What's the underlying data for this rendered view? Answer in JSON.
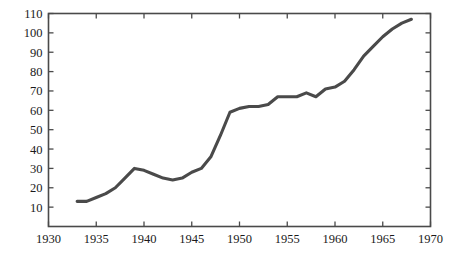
{
  "chart_data": {
    "type": "line",
    "title": "",
    "subtitle": "",
    "xlabel": "",
    "ylabel": "",
    "xlim": [
      1930,
      1970
    ],
    "ylim": [
      0,
      110
    ],
    "grid": false,
    "legend": null,
    "legend_position": "none",
    "x_ticks": [
      1930,
      1935,
      1940,
      1945,
      1950,
      1955,
      1960,
      1965,
      1970
    ],
    "x_tick_labels": [
      "1930",
      "1935",
      "1940",
      "1945",
      "1950",
      "1955",
      "1960",
      "1965",
      "1970"
    ],
    "y_ticks": [
      10,
      20,
      30,
      40,
      50,
      60,
      70,
      80,
      90,
      100,
      110
    ],
    "y_tick_labels": [
      "10",
      "20",
      "30",
      "40",
      "50",
      "60",
      "70",
      "80",
      "90",
      "100",
      "110"
    ],
    "series": [
      {
        "name": "series-1",
        "color": "#4a4a4a",
        "x": [
          1933,
          1934,
          1935,
          1936,
          1937,
          1938,
          1939,
          1940,
          1941,
          1942,
          1943,
          1944,
          1945,
          1946,
          1947,
          1948,
          1949,
          1950,
          1951,
          1952,
          1953,
          1954,
          1955,
          1956,
          1957,
          1958,
          1959,
          1960,
          1961,
          1962,
          1963,
          1964,
          1965,
          1966,
          1967,
          1968
        ],
        "y": [
          13,
          13,
          15,
          17,
          20,
          25,
          30,
          29,
          27,
          25,
          24,
          25,
          28,
          30,
          36,
          47,
          59,
          61,
          62,
          62,
          63,
          67,
          67,
          67,
          69,
          67,
          71,
          72,
          75,
          81,
          88,
          93,
          98,
          102,
          105,
          107
        ]
      }
    ]
  },
  "axes": {
    "x_axis_name": "year-axis",
    "y_axis_name": "value-axis"
  }
}
